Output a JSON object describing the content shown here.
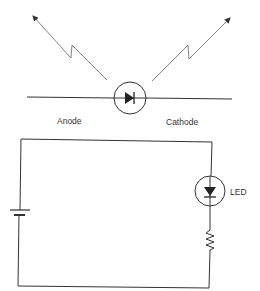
{
  "diagram": {
    "type": "circuit",
    "top_figure": {
      "component": "photodiode-symbol",
      "labels": {
        "anode": "Anode",
        "cathode": "Cathode"
      }
    },
    "bottom_figure": {
      "component": "led-circuit",
      "components": [
        "battery",
        "LED",
        "resistor"
      ],
      "labels": {
        "led": "LED"
      }
    },
    "colors": {
      "line": "#333333",
      "background": "#ffffff"
    }
  }
}
